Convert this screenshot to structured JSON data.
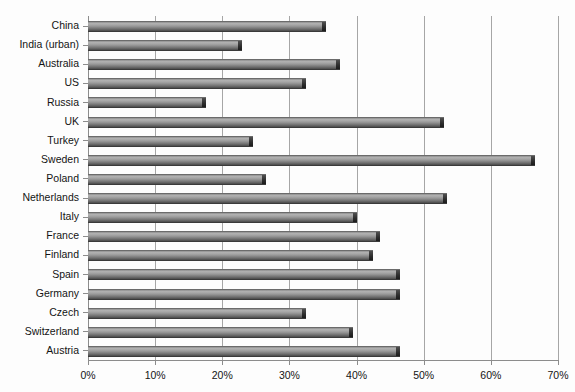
{
  "chart_data": {
    "type": "bar",
    "orientation": "horizontal",
    "title": "",
    "subtitle": "",
    "xlabel": "",
    "ylabel": "",
    "xlim": [
      0,
      70
    ],
    "xtick_labels": [
      "0%",
      "10%",
      "20%",
      "30%",
      "40%",
      "50%",
      "60%",
      "70%"
    ],
    "xtick_values": [
      0,
      10,
      20,
      30,
      40,
      50,
      60,
      70
    ],
    "grid": true,
    "legend": "none",
    "unit": "%",
    "categories": [
      "China",
      "India (urban)",
      "Australia",
      "US",
      "Russia",
      "UK",
      "Turkey",
      "Sweden",
      "Poland",
      "Netherlands",
      "Italy",
      "France",
      "Finland",
      "Spain",
      "Germany",
      "Czech",
      "Switzerland",
      "Austria"
    ],
    "values": [
      35.5,
      23.0,
      37.5,
      32.5,
      17.5,
      53.0,
      24.5,
      66.5,
      26.5,
      53.5,
      40.0,
      43.5,
      42.5,
      46.5,
      46.5,
      32.5,
      39.5,
      46.5
    ],
    "series": [
      {
        "name": "",
        "values": [
          35.5,
          23.0,
          37.5,
          32.5,
          17.5,
          53.0,
          24.5,
          66.5,
          26.5,
          53.5,
          40.0,
          43.5,
          42.5,
          46.5,
          46.5,
          32.5,
          39.5,
          46.5
        ]
      }
    ],
    "colors": {
      "bar_fill": "#9a9a9a",
      "bar_edge": "#3a3a3a",
      "grid": "#a6a6a6",
      "axis": "#8c8c8c",
      "background": "#fdfdfd",
      "text": "#141414"
    }
  }
}
